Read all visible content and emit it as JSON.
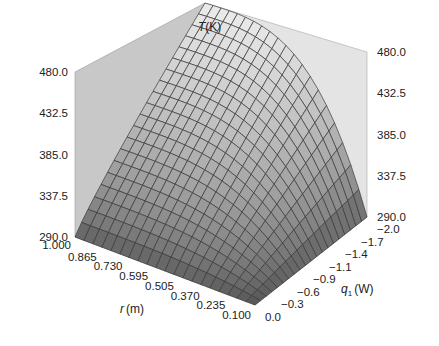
{
  "chart_data": {
    "type": "surface3d",
    "title": "",
    "zlabel": {
      "var": "T",
      "unit": "(K)"
    },
    "xlabel": {
      "var": "r",
      "unit": "(m)"
    },
    "ylabel": {
      "var": "q",
      "sub": "1",
      "unit": "(W)"
    },
    "z_ticks": [
      "290.0",
      "337.5",
      "385.0",
      "432.5",
      "480.0"
    ],
    "r_ticks": [
      "1.000",
      "0.865",
      "0.730",
      "0.595",
      "0.505",
      "0.370",
      "0.235",
      "0.100"
    ],
    "q_ticks": [
      "0.0",
      "−0.3",
      "−0.6",
      "−0.9",
      "−1.1",
      "−1.4",
      "−1.7",
      "−2.0"
    ],
    "zlim": [
      290.0,
      480.0
    ],
    "rlim": [
      0.1,
      1.0
    ],
    "qlim": [
      -2.0,
      0.0
    ],
    "grid_resolution": [
      20,
      20
    ],
    "surface_description": "T rises with r and with |q1|; peak 480 K at r=1.0, q1=-2.0; minimum 290 K along r=0.1 and q1=0 edges",
    "colors": {
      "wall": "#c8c8c8",
      "wall_light": "#e4e4e4",
      "surface_light": "#e8e8e8",
      "surface_dark": "#555555",
      "mesh": "#3a3a3a"
    }
  }
}
